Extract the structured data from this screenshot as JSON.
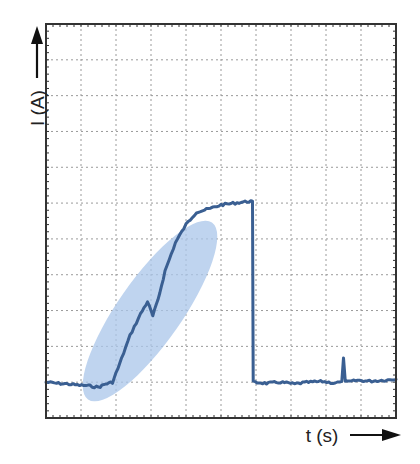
{
  "chart_data": {
    "type": "line",
    "title": "",
    "xlabel": "t (s)",
    "ylabel": "I (A)",
    "x_ticks_labeled": false,
    "y_ticks_labeled": false,
    "grid": true,
    "grid_divisions": {
      "x": 10,
      "y": 11
    },
    "xlim": [
      0,
      10
    ],
    "ylim": [
      0,
      11
    ],
    "legend": null,
    "series": [
      {
        "name": "current",
        "color": "#3a5f92",
        "points": [
          [
            0.0,
            1.0
          ],
          [
            0.3,
            0.97
          ],
          [
            0.6,
            0.95
          ],
          [
            0.9,
            0.92
          ],
          [
            1.2,
            0.9
          ],
          [
            1.5,
            0.86
          ],
          [
            1.7,
            0.95
          ],
          [
            1.9,
            1.0
          ],
          [
            2.1,
            1.5
          ],
          [
            2.4,
            2.3
          ],
          [
            2.7,
            2.9
          ],
          [
            2.9,
            3.25
          ],
          [
            3.05,
            2.85
          ],
          [
            3.2,
            3.3
          ],
          [
            3.4,
            4.1
          ],
          [
            3.7,
            4.9
          ],
          [
            4.0,
            5.4
          ],
          [
            4.3,
            5.75
          ],
          [
            4.7,
            5.85
          ],
          [
            5.0,
            5.95
          ],
          [
            5.4,
            6.0
          ],
          [
            5.8,
            6.05
          ],
          [
            5.9,
            6.05
          ],
          [
            5.92,
            1.0
          ],
          [
            6.3,
            0.97
          ],
          [
            6.7,
            1.0
          ],
          [
            7.1,
            0.95
          ],
          [
            7.5,
            1.0
          ],
          [
            7.9,
            1.02
          ],
          [
            8.2,
            0.98
          ],
          [
            8.45,
            1.0
          ],
          [
            8.5,
            1.7
          ],
          [
            8.55,
            1.0
          ],
          [
            8.9,
            1.05
          ],
          [
            9.3,
            1.03
          ],
          [
            10.0,
            1.08
          ]
        ]
      }
    ],
    "annotations": [
      {
        "type": "ellipse",
        "description": "highlighted rising region",
        "color": "#a9c6ea",
        "center": [
          3.0,
          3.0
        ],
        "angle_deg": -55
      }
    ]
  },
  "axes": {
    "x_label": "t (s)",
    "y_label": "I (A)"
  },
  "colors": {
    "trace": "#3a5f92",
    "highlight": "#a9c6ea",
    "grid": "#9a9a9a",
    "frame": "#333333"
  }
}
